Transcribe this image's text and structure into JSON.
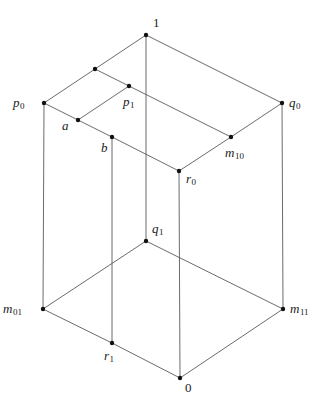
{
  "diagram": {
    "type": "lattice-hasse-diagram",
    "nodes": [
      {
        "id": "top",
        "label": "1",
        "sub": "",
        "x": 146,
        "y": 35,
        "lx": 153,
        "ly": 27,
        "italic": false
      },
      {
        "id": "u",
        "label": "",
        "sub": "",
        "x": 95,
        "y": 69,
        "lx": 0,
        "ly": 0,
        "italic": true
      },
      {
        "id": "p0",
        "label": "p",
        "sub": "0",
        "x": 44,
        "y": 103,
        "lx": 13,
        "ly": 107,
        "italic": true
      },
      {
        "id": "p1",
        "label": "p",
        "sub": "1",
        "x": 129,
        "y": 86,
        "lx": 123,
        "ly": 106,
        "italic": true
      },
      {
        "id": "q0",
        "label": "q",
        "sub": "0",
        "x": 282,
        "y": 103,
        "lx": 289,
        "ly": 107,
        "italic": true
      },
      {
        "id": "a",
        "label": "a",
        "sub": "",
        "x": 78,
        "y": 120,
        "lx": 62,
        "ly": 130,
        "italic": true
      },
      {
        "id": "b",
        "label": "b",
        "sub": "",
        "x": 112,
        "y": 137,
        "lx": 101,
        "ly": 152,
        "italic": true
      },
      {
        "id": "m10",
        "label": "m",
        "sub": "10",
        "x": 231,
        "y": 137,
        "lx": 225,
        "ly": 157,
        "italic": true
      },
      {
        "id": "r0",
        "label": "r",
        "sub": "0",
        "x": 179,
        "y": 171,
        "lx": 186,
        "ly": 183,
        "italic": true
      },
      {
        "id": "q1",
        "label": "q",
        "sub": "1",
        "x": 146,
        "y": 241,
        "lx": 152,
        "ly": 233,
        "italic": true
      },
      {
        "id": "m01",
        "label": "m",
        "sub": "01",
        "x": 43,
        "y": 309,
        "lx": 3,
        "ly": 313,
        "italic": true
      },
      {
        "id": "m11",
        "label": "m",
        "sub": "11",
        "x": 283,
        "y": 309,
        "lx": 290,
        "ly": 313,
        "italic": true
      },
      {
        "id": "r1",
        "label": "r",
        "sub": "1",
        "x": 112,
        "y": 343,
        "lx": 104,
        "ly": 360,
        "italic": true
      },
      {
        "id": "bottom",
        "label": "0",
        "sub": "",
        "x": 180,
        "y": 378,
        "lx": 185,
        "ly": 392,
        "italic": false
      }
    ],
    "edges": [
      [
        "top",
        "u"
      ],
      [
        "u",
        "p0"
      ],
      [
        "top",
        "q0"
      ],
      [
        "u",
        "p1"
      ],
      [
        "p1",
        "a"
      ],
      [
        "p0",
        "a"
      ],
      [
        "a",
        "b"
      ],
      [
        "b",
        "r0"
      ],
      [
        "p1",
        "m10"
      ],
      [
        "q0",
        "m10"
      ],
      [
        "m10",
        "r0"
      ],
      [
        "top",
        "q1"
      ],
      [
        "p0",
        "m01"
      ],
      [
        "b",
        "r1"
      ],
      [
        "r0",
        "bottom"
      ],
      [
        "q0",
        "m11"
      ],
      [
        "q1",
        "m01"
      ],
      [
        "q1",
        "m11"
      ],
      [
        "m01",
        "r1"
      ],
      [
        "r1",
        "bottom"
      ],
      [
        "m11",
        "bottom"
      ]
    ]
  },
  "labels": {
    "top": "1",
    "p0": "p0",
    "p1": "p1",
    "q0": "q0",
    "a": "a",
    "b": "b",
    "m10": "m10",
    "r0": "r0",
    "q1": "q1",
    "m01": "m01",
    "m11": "m11",
    "r1": "r1",
    "bottom": "0"
  }
}
